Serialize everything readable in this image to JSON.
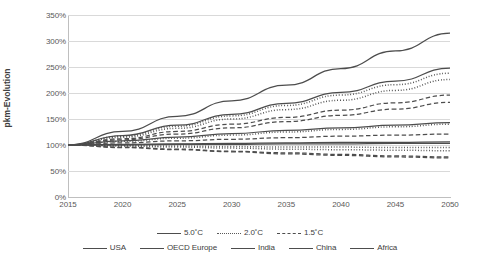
{
  "chart_data": {
    "type": "line",
    "title": "",
    "xlabel": "",
    "ylabel": "pkm-Evolution",
    "xlim": [
      2015,
      2050
    ],
    "ylim": [
      0,
      350
    ],
    "grid": true,
    "legend_position": "bottom",
    "x": [
      2015,
      2020,
      2025,
      2030,
      2035,
      2040,
      2045,
      2050
    ],
    "x_ticks": [
      "2015",
      "2020",
      "2025",
      "2030",
      "2035",
      "2040",
      "2045",
      "2050"
    ],
    "y_ticks": [
      "0%",
      "50%",
      "100%",
      "150%",
      "200%",
      "250%",
      "300%",
      "350%"
    ],
    "y_tick_values": [
      0,
      50,
      100,
      150,
      200,
      250,
      300,
      350
    ],
    "scenarios": [
      {
        "name": "5.0˚C",
        "style": "solid"
      },
      {
        "name": "2.0˚C",
        "style": "dotted"
      },
      {
        "name": "1.5˚C",
        "style": "dashed"
      }
    ],
    "regions": [
      "USA",
      "OECD Europe",
      "India",
      "China",
      "Africa"
    ],
    "series": [
      {
        "name": "India 5.0˚C",
        "region": "India",
        "scenario": "5.0˚C",
        "style": "solid",
        "values": [
          100,
          126,
          155,
          185,
          215,
          247,
          281,
          315
        ]
      },
      {
        "name": "Africa 5.0˚C",
        "region": "Africa",
        "scenario": "5.0˚C",
        "style": "solid",
        "values": [
          100,
          118,
          138,
          159,
          180,
          201,
          223,
          248
        ]
      },
      {
        "name": "India 2.0˚C",
        "region": "India",
        "scenario": "2.0˚C",
        "style": "dotted",
        "values": [
          100,
          117,
          136,
          156,
          176,
          196,
          216,
          238
        ]
      },
      {
        "name": "Africa 2.0˚C",
        "region": "Africa",
        "scenario": "2.0˚C",
        "style": "dotted",
        "values": [
          100,
          115,
          132,
          150,
          168,
          186,
          205,
          226
        ]
      },
      {
        "name": "India 1.5˚C",
        "region": "India",
        "scenario": "1.5˚C",
        "style": "dashed",
        "values": [
          100,
          112,
          126,
          140,
          153,
          167,
          181,
          196
        ]
      },
      {
        "name": "Africa 1.5˚C",
        "region": "Africa",
        "scenario": "1.5˚C",
        "style": "dashed",
        "values": [
          100,
          110,
          121,
          133,
          145,
          157,
          169,
          182
        ]
      },
      {
        "name": "China 5.0˚C",
        "region": "China",
        "scenario": "5.0˚C",
        "style": "solid",
        "values": [
          100,
          108,
          115,
          122,
          128,
          133,
          138,
          143
        ]
      },
      {
        "name": "China 2.0˚C",
        "region": "China",
        "scenario": "2.0˚C",
        "style": "dotted",
        "values": [
          100,
          107,
          113,
          119,
          125,
          130,
          135,
          140
        ]
      },
      {
        "name": "China 1.5˚C",
        "region": "China",
        "scenario": "1.5˚C",
        "style": "dashed",
        "values": [
          100,
          104,
          108,
          111,
          114,
          117,
          119,
          121
        ]
      },
      {
        "name": "USA 5.0˚C",
        "region": "USA",
        "scenario": "5.0˚C",
        "style": "solid",
        "values": [
          100,
          101,
          102,
          103,
          104,
          105,
          105,
          106
        ]
      },
      {
        "name": "OECD Europe 5.0˚C",
        "region": "OECD Europe",
        "scenario": "5.0˚C",
        "style": "solid",
        "values": [
          100,
          100,
          101,
          101,
          102,
          102,
          103,
          103
        ]
      },
      {
        "name": "USA 2.0˚C",
        "region": "USA",
        "scenario": "2.0˚C",
        "style": "dotted",
        "values": [
          100,
          99,
          98,
          97,
          96,
          96,
          95,
          95
        ]
      },
      {
        "name": "OECD Europe 2.0˚C",
        "region": "OECD Europe",
        "scenario": "2.0˚C",
        "style": "dotted",
        "values": [
          100,
          98,
          96,
          94,
          92,
          91,
          90,
          89
        ]
      },
      {
        "name": "USA 1.5˚C",
        "region": "USA",
        "scenario": "1.5˚C",
        "style": "dashed",
        "values": [
          100,
          96,
          92,
          88,
          85,
          82,
          79,
          77
        ]
      },
      {
        "name": "OECD Europe 1.5˚C",
        "region": "OECD Europe",
        "scenario": "1.5˚C",
        "style": "dashed",
        "values": [
          100,
          95,
          91,
          87,
          83,
          80,
          77,
          75
        ]
      }
    ]
  },
  "axes": {
    "y_label": "pkm-Evolution"
  },
  "legend": {
    "scenario_items": [
      {
        "label": "5.0˚C",
        "style": "solid"
      },
      {
        "label": "2.0˚C",
        "style": "dotted"
      },
      {
        "label": "1.5˚C",
        "style": "dashed"
      }
    ],
    "region_items": [
      {
        "label": "USA",
        "style": "solid"
      },
      {
        "label": "OECD Europe",
        "style": "solid"
      },
      {
        "label": "India",
        "style": "solid"
      },
      {
        "label": "China",
        "style": "solid"
      },
      {
        "label": "Africa",
        "style": "solid"
      }
    ]
  },
  "colors": {
    "line": "#4d4d4d",
    "grid": "#d9d9d9",
    "text": "#595959",
    "axis": "#bfbfbf"
  }
}
